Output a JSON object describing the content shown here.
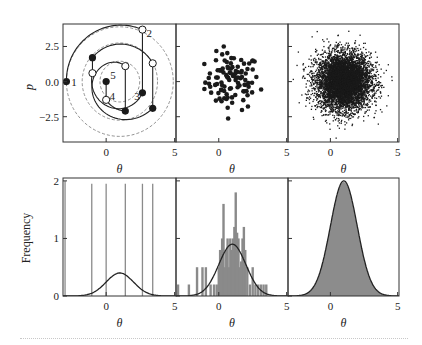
{
  "figure": {
    "width": 422,
    "height": 345,
    "colors": {
      "axis": "#333333",
      "line": "#222222",
      "bar": "#8a8a8a",
      "fill": "#8c8c8c",
      "dashed": "#777777",
      "point": "#1a1a1a"
    }
  },
  "layout": {
    "columns_px": [
      [
        63,
        176
      ],
      [
        176,
        288
      ],
      [
        288,
        399
      ]
    ],
    "rows_px": [
      [
        24,
        142
      ],
      [
        178,
        296
      ]
    ],
    "theta_range": [
      -3.15,
      5.1
    ],
    "p_range": [
      -4.3,
      4.1
    ],
    "freq_range": [
      0,
      2.05
    ]
  },
  "chart_data": [
    {
      "panel": "top-left",
      "type": "scatter",
      "title": "",
      "xlabel": "θ",
      "ylabel": "p",
      "xticks": [
        0,
        5
      ],
      "xtick_labels": [
        "0",
        "5"
      ],
      "yticks": [
        2.5,
        0.0,
        -2.5
      ],
      "ytick_labels": [
        "2.5",
        "0.0",
        "−2.5"
      ],
      "xlim": [
        -3.15,
        5.1
      ],
      "ylim": [
        -4.3,
        4.1
      ],
      "dashed_circles": {
        "center": [
          1.0,
          0.0
        ],
        "radii": [
          1.45,
          2.75,
          3.9
        ]
      },
      "trajectory_arcs": [
        {
          "from": [
            -2.9,
            0.0
          ],
          "to": [
            2.65,
            3.7
          ],
          "center": [
            1.0,
            0.0
          ]
        },
        {
          "from": [
            -1.0,
            1.7
          ],
          "to": [
            3.4,
            1.3
          ],
          "center": [
            1.0,
            0.0
          ]
        },
        {
          "from": [
            2.65,
            -0.8
          ],
          "to": [
            -1.0,
            0.6
          ],
          "center": [
            1.0,
            0.0
          ],
          "direction": "cw"
        },
        {
          "from": [
            3.4,
            -1.9
          ],
          "to": [
            1.4,
            1.1
          ],
          "center": [
            1.0,
            0.0
          ],
          "direction": "cw_long"
        },
        {
          "from": [
            1.4,
            -2.1
          ],
          "to": [
            0.0,
            -1.3
          ],
          "center": [
            1.0,
            0.0
          ],
          "direction": "cw"
        }
      ],
      "momentum_jumps": [
        {
          "theta": 2.65,
          "p_from": 3.7,
          "p_to": -0.8
        },
        {
          "theta": 3.4,
          "p_from": 1.3,
          "p_to": -1.9
        },
        {
          "theta": -1.0,
          "p_from": 1.7,
          "p_to": 0.6
        },
        {
          "theta": 1.4,
          "p_from": 1.1,
          "p_to": -2.1
        },
        {
          "theta": 0.0,
          "p_from": -1.3,
          "p_to": 0.0
        }
      ],
      "filled_points": [
        [
          -2.9,
          0.0
        ],
        [
          2.65,
          -0.8
        ],
        [
          3.4,
          -1.9
        ],
        [
          -1.0,
          1.7
        ],
        [
          1.4,
          -2.1
        ],
        [
          0.0,
          0.0
        ]
      ],
      "open_points": [
        [
          2.65,
          3.7
        ],
        [
          3.4,
          1.3
        ],
        [
          -1.0,
          0.6
        ],
        [
          1.4,
          1.1
        ],
        [
          0.0,
          -1.3
        ]
      ],
      "annotations": [
        {
          "text": "1",
          "x": -2.55,
          "y": 0.0
        },
        {
          "text": "2",
          "x": 2.95,
          "y": 3.45
        },
        {
          "text": "3",
          "x": 2.05,
          "y": -1.05
        },
        {
          "text": "4",
          "x": 0.25,
          "y": -1.05
        },
        {
          "text": "5",
          "x": 0.3,
          "y": 0.45
        }
      ]
    },
    {
      "panel": "top-middle",
      "type": "scatter",
      "xlabel": "θ",
      "xticks": [
        0,
        5
      ],
      "xtick_labels": [
        "0",
        "5"
      ],
      "xlim": [
        -3.15,
        5.1
      ],
      "ylim": [
        -4.3,
        4.1
      ],
      "n_points": 100,
      "distribution": {
        "mean_theta": 1.0,
        "mean_p": 0.0,
        "sd": 1.0
      },
      "marker": "filled-circle"
    },
    {
      "panel": "top-right",
      "type": "scatter",
      "xlabel": "θ",
      "xticks": [
        0,
        5
      ],
      "xtick_labels": [
        "0",
        "5"
      ],
      "xlim": [
        -3.15,
        5.1
      ],
      "ylim": [
        -4.3,
        4.1
      ],
      "n_points": 6000,
      "distribution": {
        "mean_theta": 1.0,
        "mean_p": 0.0,
        "sd": 1.0
      },
      "marker": "small-dot"
    },
    {
      "panel": "bottom-left",
      "type": "bar",
      "xlabel": "θ",
      "ylabel": "Frequency",
      "xticks": [
        0,
        5
      ],
      "xtick_labels": [
        "0",
        "5"
      ],
      "yticks": [
        0,
        1,
        2
      ],
      "ytick_labels": [
        "0",
        "1",
        "2"
      ],
      "xlim": [
        -3.15,
        5.1
      ],
      "ylim": [
        0,
        2.05
      ],
      "bars": {
        "theta": [
          -3.0,
          -1.05,
          0.0,
          1.4,
          2.65,
          3.4
        ],
        "height": [
          2.0,
          1.95,
          1.95,
          1.95,
          1.95,
          1.95
        ]
      },
      "density_curve": {
        "mean": 1.0,
        "sd": 1.0,
        "peak": 0.4
      }
    },
    {
      "panel": "bottom-middle",
      "type": "bar",
      "xlabel": "θ",
      "xticks": [
        0,
        5
      ],
      "xtick_labels": [
        "0",
        "5"
      ],
      "xlim": [
        -3.15,
        5.1
      ],
      "ylim": [
        0,
        2.05
      ],
      "histogram": {
        "theta": [
          -3.0,
          -2.2,
          -1.6,
          -1.2,
          -0.95,
          -0.6,
          -0.35,
          -0.15,
          0.0,
          0.1,
          0.25,
          0.35,
          0.45,
          0.55,
          0.65,
          0.75,
          0.85,
          0.95,
          1.05,
          1.15,
          1.25,
          1.35,
          1.45,
          1.55,
          1.65,
          1.75,
          1.85,
          1.95,
          2.1,
          2.3,
          2.5,
          2.7,
          2.9,
          3.1,
          3.3,
          3.5
        ],
        "height": [
          0.2,
          0.2,
          0.5,
          0.5,
          0.5,
          0.2,
          0.2,
          0.2,
          0.5,
          0.8,
          1.0,
          1.6,
          0.5,
          0.8,
          1.0,
          0.5,
          1.0,
          0.8,
          1.0,
          1.2,
          1.8,
          1.1,
          1.0,
          0.5,
          0.6,
          1.0,
          1.2,
          0.8,
          0.5,
          0.2,
          0.5,
          0.2,
          0.2,
          0.2,
          0.2,
          0.2
        ]
      },
      "density_curve": {
        "mean": 1.0,
        "sd": 1.0,
        "peak": 0.9
      }
    },
    {
      "panel": "bottom-right",
      "type": "area",
      "xlabel": "θ",
      "xticks": [
        0,
        5
      ],
      "xtick_labels": [
        "0",
        "5"
      ],
      "xlim": [
        -3.15,
        5.1
      ],
      "ylim": [
        0,
        2.05
      ],
      "histogram_fill": {
        "mean": 1.0,
        "sd": 1.0,
        "peak": 1.98
      },
      "density_curve": {
        "mean": 1.0,
        "sd": 1.0,
        "peak": 2.0
      }
    }
  ],
  "labels": {
    "theta": "θ",
    "p": "p",
    "frequency": "Frequency"
  }
}
